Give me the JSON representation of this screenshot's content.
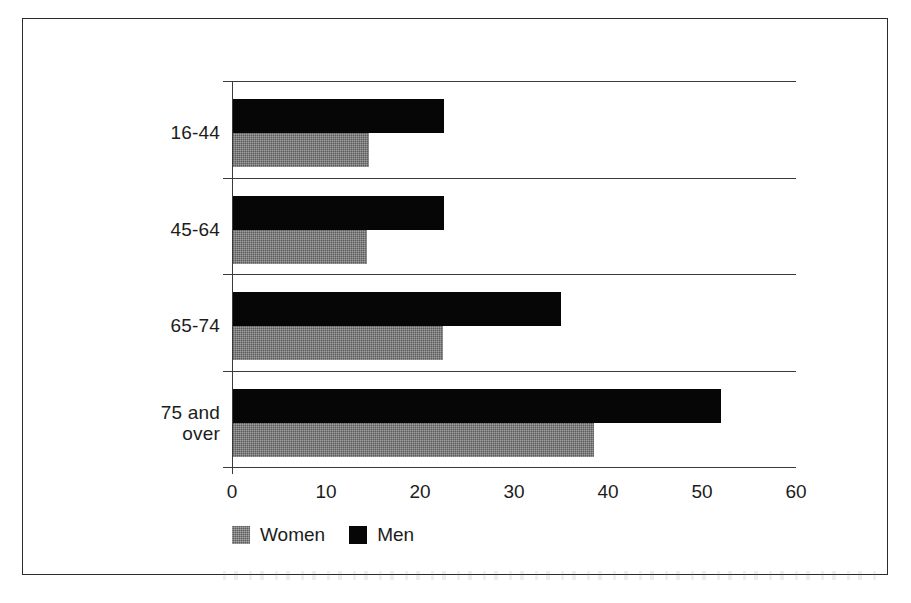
{
  "chart_data": {
    "type": "bar",
    "orientation": "horizontal",
    "title": "",
    "subtitle": "",
    "xlabel": "",
    "ylabel": "",
    "categories": [
      "16-44",
      "45-64",
      "65-74",
      "75 and over"
    ],
    "series": [
      {
        "name": "Women",
        "color": "#5c5c5c",
        "values": [
          14.6,
          14.4,
          22.4,
          38.5
        ]
      },
      {
        "name": "Men",
        "color": "#060606",
        "values": [
          22.5,
          22.5,
          35.0,
          52.0
        ]
      }
    ],
    "xlim": [
      0,
      60
    ],
    "xticks": [
      0,
      10,
      20,
      30,
      40,
      50,
      60
    ],
    "xtick_labels": [
      "0",
      "10",
      "20",
      "30",
      "40",
      "50",
      "60"
    ],
    "grid": true,
    "grid_axis": "y",
    "legend_position": "bottom-left",
    "series_order_in_group": [
      "Men",
      "Women"
    ],
    "frame": true
  },
  "legend": {
    "items": [
      {
        "label": "Women",
        "swatch": "women-swatch"
      },
      {
        "label": "Men",
        "swatch": "men-swatch"
      }
    ]
  },
  "category_labels": [
    {
      "lines": [
        "16-44"
      ]
    },
    {
      "lines": [
        "45-64"
      ]
    },
    {
      "lines": [
        "65-74"
      ]
    },
    {
      "lines": [
        "75 and",
        "over"
      ]
    }
  ],
  "axis": {
    "tick_labels": [
      "0",
      "10",
      "20",
      "30",
      "40",
      "50",
      "60"
    ]
  }
}
